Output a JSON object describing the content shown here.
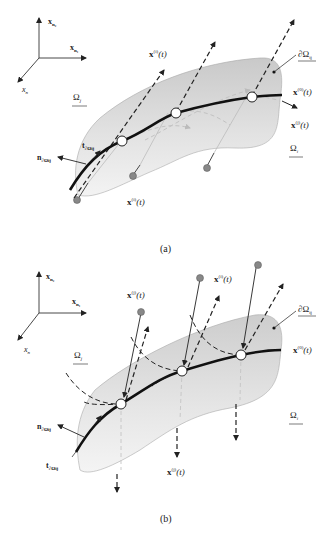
{
  "figure": {
    "panels": [
      {
        "id": "a",
        "caption": "(a)",
        "axes": {
          "up": "x",
          "up_sub": "n₂",
          "right": "x",
          "right_sub": "n₁",
          "diag": "x",
          "diag_sub": "n"
        },
        "labels": {
          "omega_j": "Ω",
          "omega_j_sub": "j",
          "omega_i": "Ω",
          "omega_i_sub": "i",
          "boundary": "∂Ω",
          "boundary_sub": "ij",
          "x0": "x",
          "x0_sup": "(0)",
          "x0_arg": "(t)",
          "xj_i": "x",
          "xj_i_sub": "j",
          "xj_i_sup": "(i)",
          "xj_i_arg": "(t)",
          "xi_j": "x",
          "xi_j_sub": "i",
          "xi_j_sup": "(j)",
          "xi_j_arg": "(t)",
          "xi_bottom": "x",
          "xi_bottom_sup": "(i)",
          "xi_bottom_arg": "(t)",
          "tangent": "t",
          "tangent_sub": "∂Ωij",
          "normal": "n",
          "normal_sub": "∂Ωij"
        }
      },
      {
        "id": "b",
        "caption": "(b)",
        "axes": {
          "up": "x",
          "up_sub": "n₂",
          "right": "x",
          "right_sub": "n₁",
          "diag": "x",
          "diag_sub": "n"
        },
        "labels": {
          "omega_j": "Ω",
          "omega_j_sub": "j",
          "omega_i": "Ω",
          "omega_i_sub": "i",
          "boundary": "∂Ω",
          "boundary_sub": "ij",
          "x0": "x",
          "x0_sup": "(0)",
          "x0_arg": "(t)",
          "xj_top": "x",
          "xj_top_sup": "(j)",
          "xj_top_arg": "(t)",
          "xj_i": "x",
          "xj_i_sub": "j",
          "xj_i_sup": "(i)",
          "xj_i_arg": "(t)",
          "xi_j": "x",
          "xi_j_sub": "i",
          "xi_j_sup": "(j)",
          "xi_j_arg": "(t)",
          "tangent": "t",
          "tangent_sub": "∂Ωij",
          "normal": "n",
          "normal_sub": "∂Ωij"
        }
      }
    ]
  }
}
